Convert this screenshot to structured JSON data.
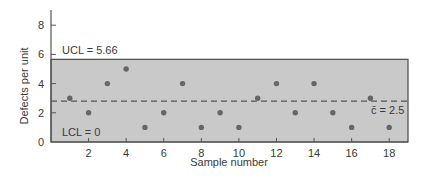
{
  "chart_data": {
    "type": "scatter",
    "title": "",
    "xlabel": "Sample number",
    "ylabel": "Defects per unit",
    "x": [
      1,
      2,
      3,
      4,
      5,
      6,
      7,
      8,
      9,
      10,
      11,
      12,
      13,
      14,
      15,
      16,
      17,
      18
    ],
    "series": [
      {
        "name": "Defects per unit",
        "values": [
          3,
          2,
          4,
          5,
          1,
          2,
          4,
          1,
          2,
          1,
          3,
          4,
          2,
          4,
          2,
          1,
          3,
          1
        ]
      }
    ],
    "xlim": [
      0,
      19
    ],
    "ylim": [
      0,
      9
    ],
    "xticks": [
      2,
      4,
      6,
      8,
      10,
      12,
      14,
      16,
      18
    ],
    "yticks": [
      0,
      2,
      4,
      6,
      8
    ],
    "control_limits": {
      "ucl": 5.66,
      "center": 2.5,
      "lcl": 0
    },
    "annotations": [
      {
        "text": "UCL = 5.66",
        "target": "ucl"
      },
      {
        "text": "LCL = 0",
        "target": "lcl"
      },
      {
        "text": "c̄ = 2.5",
        "target": "center"
      }
    ],
    "grid": false,
    "legend": "none",
    "colors": {
      "band_fill": "#c9c9c9",
      "band_border": "#555555",
      "point": "#666666",
      "center_line": "#555555",
      "axis": "#555555"
    }
  },
  "labels": {
    "ucl": "UCL = 5.66",
    "lcl": "LCL = 0",
    "center": "c̄ = 2.5",
    "xlabel": "Sample number",
    "ylabel": "Defects per unit"
  }
}
